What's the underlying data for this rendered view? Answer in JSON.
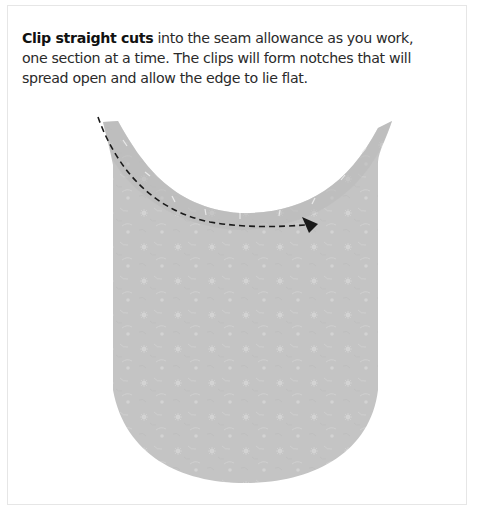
{
  "instruction": {
    "bold_lead": "Clip straight cuts",
    "body": " into the seam allowance as you work, one section at a time. The clips will form notches that will spread open and allow the edge to lie flat."
  },
  "illustration": {
    "subject": "fabric-piece-with-curved-neckline",
    "fabric_color": "#c4c4c4",
    "fabric_edge_color": "#b3b3b3",
    "arrow_color": "#1a1a1a",
    "arrow_style": "dashed",
    "icons": [
      "dashed-arrow-icon"
    ]
  },
  "frame": {
    "border_color": "#e6e6e6"
  }
}
